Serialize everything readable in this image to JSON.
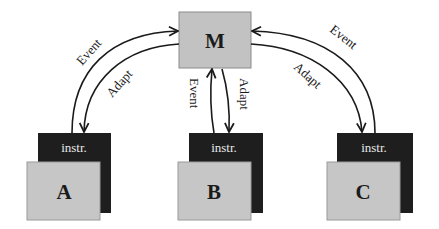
{
  "diagram": {
    "center_node": {
      "label": "M",
      "color": "#c2c2c2"
    },
    "nodes": [
      {
        "id": "A",
        "label": "A",
        "instr_label": "instr."
      },
      {
        "id": "B",
        "label": "B",
        "instr_label": "instr."
      },
      {
        "id": "C",
        "label": "C",
        "instr_label": "instr."
      }
    ],
    "edges": [
      {
        "from": "A",
        "to": "M",
        "label": "Event"
      },
      {
        "from": "M",
        "to": "A",
        "label": "Adapt"
      },
      {
        "from": "B",
        "to": "M",
        "label": "Event"
      },
      {
        "from": "M",
        "to": "B",
        "label": "Adapt"
      },
      {
        "from": "C",
        "to": "M",
        "label": "Event"
      },
      {
        "from": "M",
        "to": "C",
        "label": "Adapt"
      }
    ],
    "colors": {
      "node_fill": "#c6c6c6",
      "instr_fill": "#1e1e1e",
      "instr_text": "#e8e8e8",
      "line": "#1a1a1a"
    }
  }
}
